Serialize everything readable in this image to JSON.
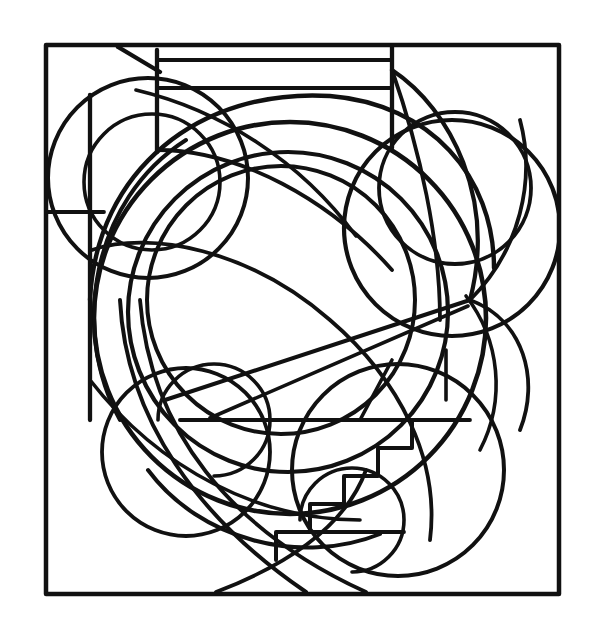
{
  "canvas": {
    "width": 596,
    "height": 640,
    "background_color": "#ffffff",
    "ink_color": "#111111",
    "title": "Abstract Geometric Line Drawing",
    "style": "black and white line art / coloring page",
    "description": "Square frame enclosing nested circles, sweeping spiral arcs, petal shapes at right and a stepped staircase motif at lower right."
  },
  "frame": {
    "name": "outer-frame",
    "left": 46,
    "top": 45,
    "right": 559,
    "bottom": 594,
    "stroke_width": 4.5
  },
  "geometry": {
    "stroke_width_major": 4.5,
    "stroke_width_minor": 3.4,
    "circles": [
      {
        "name": "outer-ring",
        "cx": 290,
        "cy": 318,
        "r": 196,
        "stroke_width": 4.6
      },
      {
        "name": "inner-ring",
        "cx": 288,
        "cy": 312,
        "r": 160,
        "stroke_width": 4.2
      },
      {
        "name": "core-circle",
        "cx": 281,
        "cy": 300,
        "r": 134,
        "stroke_width": 4.0
      },
      {
        "name": "upper-left-lobe",
        "cx": 148,
        "cy": 178,
        "r": 100,
        "stroke_width": 4.0
      },
      {
        "name": "upper-left-lobe-inner",
        "cx": 152,
        "cy": 182,
        "r": 68,
        "stroke_width": 3.6
      },
      {
        "name": "right-outer-lobe",
        "cx": 452,
        "cy": 228,
        "r": 108,
        "stroke_width": 4.2
      },
      {
        "name": "right-petal-circle",
        "cx": 455,
        "cy": 188,
        "r": 76,
        "stroke_width": 3.8
      },
      {
        "name": "lower-left-lobe",
        "cx": 186,
        "cy": 452,
        "r": 84,
        "stroke_width": 3.8
      },
      {
        "name": "lower-left-lobe-small",
        "cx": 214,
        "cy": 420,
        "r": 56,
        "stroke_width": 3.6
      },
      {
        "name": "lower-right-lobe",
        "cx": 398,
        "cy": 470,
        "r": 106,
        "stroke_width": 4.0
      },
      {
        "name": "bottom-small-circle",
        "cx": 352,
        "cy": 520,
        "r": 52,
        "stroke_width": 3.6
      }
    ],
    "rect_bands": [
      {
        "name": "top-band-upper",
        "x1": 157,
        "y1": 60,
        "x2": 392,
        "y2": 60
      },
      {
        "name": "top-band-lower",
        "x1": 157,
        "y1": 88,
        "x2": 392,
        "y2": 88
      },
      {
        "name": "left-vertical-divider",
        "x1": 157,
        "y1": 50,
        "x2": 157,
        "y2": 152
      },
      {
        "name": "right-vertical-divider",
        "x1": 392,
        "y1": 46,
        "x2": 392,
        "y2": 148
      },
      {
        "name": "left-inner-vertical",
        "x1": 90,
        "y1": 95,
        "x2": 90,
        "y2": 420
      },
      {
        "name": "left-horizontal-tick",
        "x1": 47,
        "y1": 212,
        "x2": 104,
        "y2": 212
      },
      {
        "name": "diagonal-corner-bevel",
        "x1": 118,
        "y1": 47,
        "x2": 160,
        "y2": 72
      }
    ],
    "staircase": {
      "name": "stepped-motif",
      "steps": 4,
      "x_start": 412,
      "y_start": 420,
      "step_width": 34,
      "step_height": 28,
      "direction": "down-left"
    },
    "chords": [
      {
        "name": "center-chord-long",
        "x1": 165,
        "y1": 400,
        "x2": 470,
        "y2": 300
      },
      {
        "name": "center-chord-lower",
        "x1": 210,
        "y1": 418,
        "x2": 468,
        "y2": 306
      },
      {
        "name": "base-chord",
        "x1": 180,
        "y1": 420,
        "x2": 430,
        "y2": 420
      }
    ]
  },
  "labels": {
    "none_visible": ""
  }
}
